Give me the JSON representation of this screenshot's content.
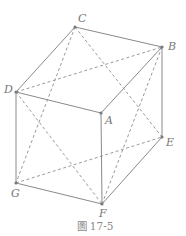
{
  "figure": {
    "caption": "圖 17-5",
    "colors": {
      "solid_edge": "#8a8a8a",
      "dashed_edge": "#9a9a9a",
      "label": "#777777"
    }
  },
  "vertices": [
    {
      "id": "A",
      "label": "A",
      "x": 101,
      "y": 113,
      "lx": 105,
      "ly": 124
    },
    {
      "id": "B",
      "label": "B",
      "x": 162,
      "y": 47,
      "lx": 168,
      "ly": 50
    },
    {
      "id": "C",
      "label": "C",
      "x": 75,
      "y": 27,
      "lx": 78,
      "ly": 22
    },
    {
      "id": "D",
      "label": "D",
      "x": 16,
      "y": 92,
      "lx": 4,
      "ly": 93
    },
    {
      "id": "E",
      "label": "E",
      "x": 162,
      "y": 137,
      "lx": 166,
      "ly": 146
    },
    {
      "id": "F",
      "label": "F",
      "x": 102,
      "y": 204,
      "lx": 99,
      "ly": 217
    },
    {
      "id": "G",
      "label": "G",
      "x": 16,
      "y": 183,
      "lx": 11,
      "ly": 197
    }
  ],
  "solid_edges": [
    [
      "C",
      "B"
    ],
    [
      "C",
      "D"
    ],
    [
      "D",
      "A"
    ],
    [
      "A",
      "B"
    ],
    [
      "B",
      "E"
    ],
    [
      "A",
      "F"
    ],
    [
      "D",
      "G"
    ],
    [
      "G",
      "F"
    ],
    [
      "F",
      "E"
    ]
  ],
  "dashed_edges": [
    [
      "C",
      "G"
    ],
    [
      "C",
      "E"
    ],
    [
      "G",
      "E"
    ],
    [
      "D",
      "B"
    ],
    [
      "D",
      "F"
    ],
    [
      "B",
      "F"
    ]
  ]
}
